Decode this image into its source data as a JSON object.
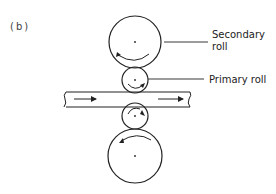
{
  "figure": {
    "label": "(b)",
    "labels": {
      "secondary_line1": "Secondary",
      "secondary_line2": "roll",
      "primary": "Primary roll"
    }
  },
  "diagram": {
    "type": "rolling-mill-schematic",
    "components": [
      {
        "name": "upper-secondary-roll",
        "cx": 135,
        "cy": 42,
        "r": 26,
        "rotation": "counterclockwise"
      },
      {
        "name": "upper-primary-roll",
        "cx": 135,
        "cy": 80,
        "r": 13,
        "rotation": "clockwise"
      },
      {
        "name": "strip",
        "x1": 64,
        "x2": 190,
        "y_top": 92,
        "y_bottom": 107,
        "direction": "right"
      },
      {
        "name": "lower-primary-roll",
        "cx": 135,
        "cy": 116,
        "r": 13,
        "rotation": "clockwise"
      },
      {
        "name": "lower-secondary-roll",
        "cx": 135,
        "cy": 156,
        "r": 27,
        "rotation": "counterclockwise"
      }
    ],
    "stroke_color": "#222222"
  }
}
